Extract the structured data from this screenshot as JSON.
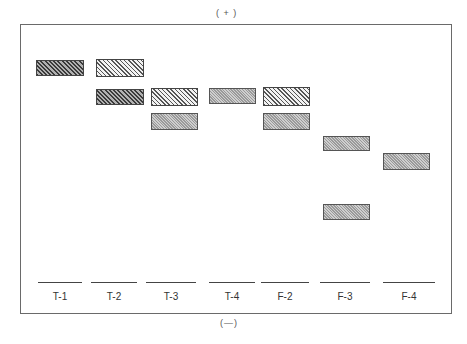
{
  "diagram": {
    "type": "electrophoresis-gel",
    "pole_top": "( + )",
    "pole_bottom": "(—)",
    "lanes": [
      {
        "label": "T-1",
        "bands": [
          {
            "style": "dark",
            "x": 36,
            "y": 60,
            "w": 48,
            "h": 16
          }
        ],
        "origin": {
          "x": 38,
          "w": 44
        }
      },
      {
        "label": "T-2",
        "bands": [
          {
            "style": "light",
            "x": 96,
            "y": 59,
            "w": 48,
            "h": 18
          },
          {
            "style": "dark",
            "x": 96,
            "y": 89,
            "w": 48,
            "h": 16
          }
        ],
        "origin": {
          "x": 91,
          "w": 46
        }
      },
      {
        "label": "T-3",
        "bands": [
          {
            "style": "light",
            "x": 151,
            "y": 88,
            "w": 47,
            "h": 18
          },
          {
            "style": "stip",
            "x": 151,
            "y": 113,
            "w": 47,
            "h": 17
          }
        ],
        "origin": {
          "x": 146,
          "w": 50
        }
      },
      {
        "label": "T-4",
        "bands": [
          {
            "style": "stip",
            "x": 209,
            "y": 88,
            "w": 47,
            "h": 16
          }
        ],
        "origin": {
          "x": 209,
          "w": 46
        }
      },
      {
        "label": "F-2",
        "bands": [
          {
            "style": "light",
            "x": 263,
            "y": 87,
            "w": 47,
            "h": 19
          },
          {
            "style": "stip",
            "x": 263,
            "y": 113,
            "w": 47,
            "h": 17
          }
        ],
        "origin": {
          "x": 261,
          "w": 48
        }
      },
      {
        "label": "F-3",
        "bands": [
          {
            "style": "stip",
            "x": 323,
            "y": 136,
            "w": 47,
            "h": 15
          },
          {
            "style": "stip",
            "x": 323,
            "y": 204,
            "w": 47,
            "h": 16
          }
        ],
        "origin": {
          "x": 320,
          "w": 50
        }
      },
      {
        "label": "F-4",
        "bands": [
          {
            "style": "stip",
            "x": 383,
            "y": 153,
            "w": 47,
            "h": 17
          }
        ],
        "origin": {
          "x": 383,
          "w": 52
        }
      }
    ]
  }
}
